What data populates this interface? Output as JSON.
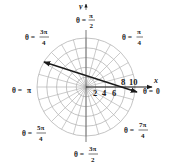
{
  "diagram": {
    "type": "polar-grid",
    "center": [
      86,
      87
    ],
    "radius_px": 49,
    "circle_values": [
      "2",
      "4",
      "6",
      "8",
      "10"
    ],
    "spoke_step_deg": 15,
    "axis_labels": {
      "x": "x",
      "y": "y"
    },
    "angle_labels": {
      "theta0": {
        "lhs": "θ =",
        "value": "0"
      },
      "theta45": {
        "lhs": "θ =",
        "num": "π",
        "den": "4"
      },
      "theta90": {
        "lhs": "θ =",
        "num": "π",
        "den": "2"
      },
      "theta135": {
        "lhs": "θ =",
        "num": "3π",
        "den": "4"
      },
      "theta180": {
        "lhs": "θ =",
        "value": "π"
      },
      "theta225": {
        "lhs": "θ =",
        "num": "5π",
        "den": "4"
      },
      "theta270": {
        "lhs": "θ =",
        "num": "3π",
        "den": "2"
      },
      "theta315": {
        "lhs": "θ =",
        "num": "7π",
        "den": "4"
      }
    },
    "ticks": {
      "t2": "2",
      "t4": "4",
      "t6": "6",
      "t8": "8",
      "t10": "10"
    },
    "line": {
      "from": [
        44,
        62
      ],
      "to": [
        137,
        92
      ],
      "double_headed": true
    },
    "colors": {
      "grid": "#b5b5b5",
      "ink": "#1a1a1a",
      "background": "#ffffff"
    }
  }
}
